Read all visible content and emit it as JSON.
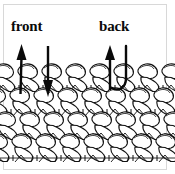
{
  "diagram": {
    "title_front": "front",
    "title_back": "back",
    "colors": {
      "ink": "#0a0a0a",
      "fabric_line": "#111111",
      "background": "#ffffff",
      "frame": "#d8d8d8"
    },
    "annotations": [
      {
        "name": "front-hook-out-arrow",
        "icon": "up-arrow-icon",
        "direction": "up",
        "side": "front",
        "x": 20,
        "y_top": 45,
        "y_bottom": 94
      },
      {
        "name": "front-hook-in-arrow",
        "icon": "down-arrow-icon",
        "direction": "down",
        "side": "front",
        "x": 48,
        "y_top": 46,
        "y_bottom": 96
      },
      {
        "name": "back-hook-out-arrow",
        "icon": "up-arrow-icon",
        "direction": "up",
        "side": "back",
        "x": 110,
        "y_top": 45,
        "y_bottom": 90
      },
      {
        "name": "back-hook-in-path",
        "icon": "u-turn-arrow-icon",
        "direction": "down-around-up",
        "side": "back",
        "x": 126,
        "y_top": 46,
        "y_bottom": 92
      }
    ],
    "fabric": {
      "rows": 4,
      "stitch_columns": 7,
      "style": "single-crochet",
      "top_y": 62,
      "bottom_y": 159
    }
  }
}
